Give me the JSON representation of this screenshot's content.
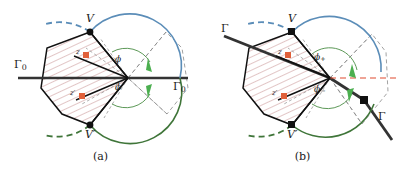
{
  "figure": {
    "type": "two-panel-geometry-diagram",
    "width": 403,
    "height": 175,
    "background": "#ffffff"
  },
  "colors": {
    "outline": "#111111",
    "hatch": "#c08080",
    "blue_arc": "#5b8db8",
    "green_arc": "#3f7539",
    "arrow_green": "#4caf50",
    "marker_orange": "#e0603a",
    "guide_gray": "#888888",
    "red_dash": "#e04a2f",
    "text": "#1a1a1a"
  },
  "panel_a": {
    "caption": "(a)",
    "labels": {
      "vertex_top": "V",
      "vertex_bottom": "V′",
      "boundary_left": "Γ",
      "boundary_left_sub": "0",
      "boundary_right": "Γ",
      "boundary_right_sub": "0",
      "angle_upper": "ϕ",
      "angle_lower": "ϕ",
      "point_z": "z",
      "point_z_prime": "z′"
    },
    "geometry": {
      "center": [
        128,
        78
      ],
      "vertex_top": [
        90,
        32
      ],
      "vertex_bottom": [
        90,
        125
      ],
      "polygon": [
        [
          90,
          32
        ],
        [
          47,
          48
        ],
        [
          41,
          88
        ],
        [
          62,
          114
        ],
        [
          90,
          125
        ],
        [
          128,
          78
        ]
      ],
      "boundary_line_y": 78,
      "boundary_line_x1": 18,
      "boundary_line_x2": 188,
      "blue_arc_radius": 52,
      "green_arc_radius": 52,
      "inner_arc_radius": 28,
      "angle_upper_deg": 50,
      "angle_lower_deg": 50
    }
  },
  "panel_b": {
    "caption": "(b)",
    "labels": {
      "vertex_top": "V",
      "vertex_bottom": "V′",
      "boundary_upper_left": "Γ",
      "boundary_lower_right": "Γ",
      "angle_upper": "ϕ",
      "angle_upper_sub": "+",
      "angle_lower": "ϕ",
      "angle_lower_sub": "−",
      "point_z": "z",
      "point_z_prime": "z′"
    },
    "geometry": {
      "center": [
        128,
        78
      ],
      "vertex_top": [
        90,
        32
      ],
      "vertex_bottom": [
        90,
        125
      ],
      "corner_right": [
        162,
        100
      ],
      "polygon": [
        [
          90,
          32
        ],
        [
          47,
          48
        ],
        [
          41,
          88
        ],
        [
          62,
          114
        ],
        [
          90,
          125
        ],
        [
          128,
          78
        ]
      ],
      "boundary_left_end": [
        22,
        36
      ],
      "boundary_right_end": [
        190,
        140
      ],
      "blue_arc_radius": 52,
      "green_arc_radius": 52,
      "inner_arc_radius": 28,
      "angle_upper_deg": 56,
      "angle_lower_deg": 44
    }
  }
}
